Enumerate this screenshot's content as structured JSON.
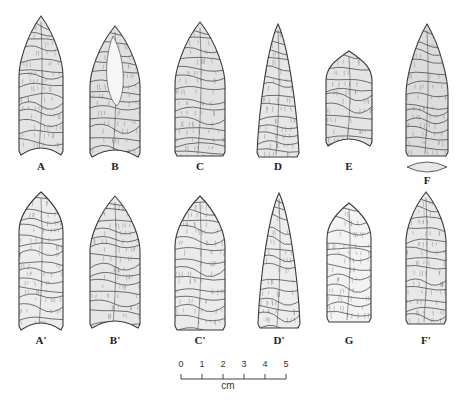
{
  "figure": {
    "points": [
      {
        "id": "A",
        "label": "A",
        "row": 1,
        "cx": 41,
        "top": 16,
        "bottom": 155,
        "width": 44,
        "shoulder": 60,
        "base": "concave",
        "fill": "#e4e4e4"
      },
      {
        "id": "B",
        "label": "B",
        "row": 1,
        "cx": 115,
        "top": 26,
        "bottom": 157,
        "width": 50,
        "shoulder": 60,
        "base": "concave-eared",
        "fill": "#e0e0e0"
      },
      {
        "id": "C",
        "label": "C",
        "row": 1,
        "cx": 200,
        "top": 22,
        "bottom": 156,
        "width": 50,
        "shoulder": 62,
        "base": "straight",
        "fill": "#e2e2e2"
      },
      {
        "id": "D",
        "label": "D",
        "row": 1,
        "cx": 278,
        "top": 24,
        "bottom": 157,
        "width": 42,
        "shoulder": 120,
        "base": "straight",
        "fill": "#e6e6e6"
      },
      {
        "id": "E",
        "label": "E",
        "row": 1,
        "cx": 349,
        "top": 51,
        "bottom": 146,
        "width": 46,
        "shoulder": 30,
        "base": "concave",
        "fill": "#e4e4e4"
      },
      {
        "id": "F",
        "label": "F",
        "row": 1,
        "cx": 427,
        "top": 24,
        "bottom": 156,
        "width": 42,
        "shoulder": 70,
        "base": "straight",
        "fill": "#dcdcdc"
      },
      {
        "id": "A2",
        "label": "A'",
        "row": 2,
        "cx": 41,
        "top": 192,
        "bottom": 330,
        "width": 44,
        "shoulder": 40,
        "base": "concave",
        "fill": "#ececec"
      },
      {
        "id": "B2",
        "label": "B'",
        "row": 2,
        "cx": 115,
        "top": 196,
        "bottom": 328,
        "width": 50,
        "shoulder": 55,
        "base": "concave-eared",
        "fill": "#e6e6e6"
      },
      {
        "id": "C2",
        "label": "C'",
        "row": 2,
        "cx": 200,
        "top": 196,
        "bottom": 330,
        "width": 50,
        "shoulder": 50,
        "base": "straight",
        "fill": "#ebebeb"
      },
      {
        "id": "D2",
        "label": "D'",
        "row": 2,
        "cx": 279,
        "top": 193,
        "bottom": 328,
        "width": 42,
        "shoulder": 120,
        "base": "straight",
        "fill": "#ececec"
      },
      {
        "id": "G",
        "label": "G",
        "row": 2,
        "cx": 349,
        "top": 203,
        "bottom": 322,
        "width": 44,
        "shoulder": 35,
        "base": "straight",
        "fill": "#f2f2f2"
      },
      {
        "id": "F2",
        "label": "F'",
        "row": 2,
        "cx": 426,
        "top": 192,
        "bottom": 324,
        "width": 40,
        "shoulder": 50,
        "base": "straight",
        "fill": "#e8e8e8"
      }
    ],
    "labels_row1_y": 160,
    "labels_row2_y": 334,
    "cross_section_F": {
      "cx": 427,
      "cy": 167,
      "rx": 20,
      "ry": 5,
      "label_y": 174
    }
  },
  "scale_bar": {
    "ticks": [
      "0",
      "1",
      "2",
      "3",
      "4",
      "5"
    ],
    "unit": "cm"
  },
  "colors": {
    "ink": "#3a3a3a",
    "background": "#ffffff"
  }
}
